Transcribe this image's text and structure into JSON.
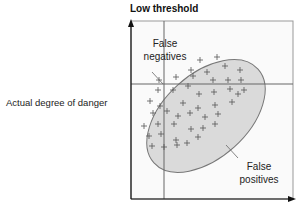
{
  "diagram": {
    "title": "Low threshold",
    "y_axis_label": "Actual degree of danger",
    "regions": {
      "false_negatives": [
        "False",
        "negatives"
      ],
      "false_positives": [
        "False",
        "positives"
      ]
    },
    "colors": {
      "ellipse_fill": "#d9d9d9",
      "ellipse_stroke": "#777777",
      "lines": "#666666",
      "marks": "#555555"
    },
    "marker_glyph": "+"
  }
}
